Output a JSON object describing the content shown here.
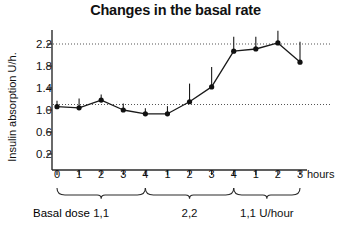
{
  "chart_data": {
    "type": "line",
    "title": "Changes in the basal rate",
    "xlabel": "hours",
    "ylabel": "Insulin absorption U/h.",
    "ylim": [
      0.0,
      2.45
    ],
    "yticks": [
      0.2,
      0.6,
      1.0,
      1.4,
      1.8,
      2.2
    ],
    "ytick_labels": [
      "0.2",
      "0.6",
      "1.0",
      "1.4",
      "1.8",
      "2.2"
    ],
    "xticks": [
      0,
      1,
      2,
      3,
      4,
      5,
      6,
      7,
      8,
      9,
      10,
      11
    ],
    "xtick_labels": [
      "0",
      "1",
      "2",
      "3",
      "4",
      "1",
      "2",
      "3",
      "4",
      "1",
      "2",
      "3"
    ],
    "grid": false,
    "legend": "none",
    "reference_lines": [
      {
        "y": 1.1,
        "style": "dotted"
      },
      {
        "y": 2.2,
        "style": "dotted"
      }
    ],
    "series": [
      {
        "name": "Insulin absorption",
        "x": [
          0,
          1,
          2,
          3,
          4,
          5,
          6,
          7,
          8,
          9,
          10,
          11,
          12
        ],
        "values": [
          1.06,
          1.04,
          1.18,
          1.0,
          0.93,
          0.93,
          1.15,
          1.42,
          2.07,
          2.11,
          2.22,
          1.87,
          null
        ],
        "err_upper": [
          0.11,
          0.17,
          0.1,
          0.12,
          0.1,
          0.14,
          0.33,
          0.36,
          0.26,
          0.22,
          0.22,
          0.37,
          null
        ],
        "marker": "filled-circle",
        "color": "#1a1a1a"
      }
    ],
    "annotations": {
      "basal_dose_label": "Basal dose",
      "segments": [
        {
          "label": "1,1",
          "from_tick": 0,
          "to_tick": 4
        },
        {
          "label": "2,2",
          "from_tick": 4,
          "to_tick": 8
        },
        {
          "label": "1,1 U/hour",
          "from_tick": 8,
          "to_tick": 11
        }
      ]
    }
  },
  "colors": {
    "axis": "#2a2a2a",
    "line": "#1a1a1a",
    "marker": "#111111",
    "reference": "#555555",
    "background": "#ffffff",
    "text": "#111111"
  }
}
